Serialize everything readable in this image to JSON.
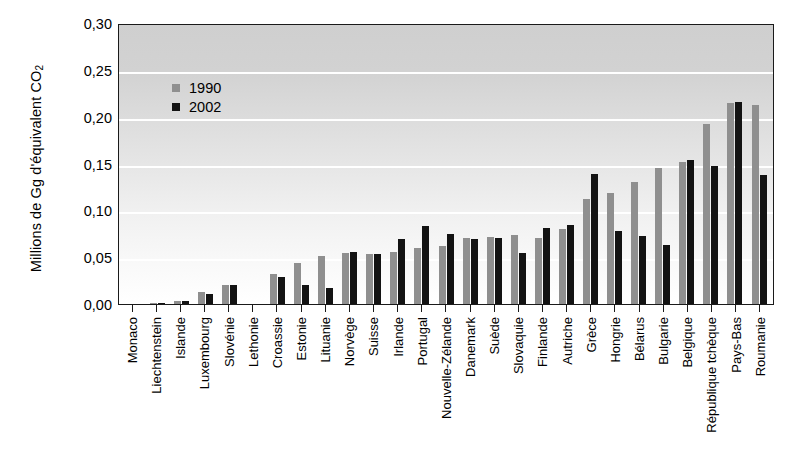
{
  "chart_data": {
    "type": "bar",
    "title": "",
    "xlabel": "",
    "ylabel": "Millions de Gg d'équivalent CO",
    "ylabel_sub": "2",
    "ylim": [
      0,
      0.3
    ],
    "ytick_labels": [
      "0,30",
      "0,25",
      "0,20",
      "0,15",
      "0,10",
      "0,05",
      "0,00"
    ],
    "ytick_values": [
      0.3,
      0.25,
      0.2,
      0.15,
      0.1,
      0.05,
      0.0
    ],
    "grid": true,
    "legend_position": "upper-left-inside",
    "categories": [
      "Monaco",
      "Liechtenstein",
      "Islande",
      "Luxembourg",
      "Slovénie",
      "Lethonie",
      "Croassie",
      "Estonie",
      "Lituanie",
      "Norvège",
      "Suisse",
      "Irlande",
      "Portugal",
      "Nouvelle-Zélande",
      "Danemark",
      "Suède",
      "Slovaquie",
      "Finlande",
      "Autriche",
      "Grèce",
      "Hongrie",
      "Bélarus",
      "Bulgarie",
      "Belgique",
      "République tchèque",
      "Pays-Bas",
      "Roumanie"
    ],
    "series": [
      {
        "name": "1990",
        "color": "#8f8f8f",
        "values": [
          0.0,
          0.001,
          0.003,
          0.013,
          0.02,
          0.0,
          0.032,
          0.044,
          0.051,
          0.054,
          0.053,
          0.055,
          0.06,
          0.062,
          0.07,
          0.072,
          0.074,
          0.071,
          0.08,
          0.112,
          0.118,
          0.13,
          0.145,
          0.152,
          0.192,
          0.215,
          0.213
        ]
      },
      {
        "name": "2002",
        "color": "#131313",
        "values": [
          0.0,
          0.001,
          0.003,
          0.011,
          0.02,
          0.0,
          0.029,
          0.02,
          0.017,
          0.055,
          0.053,
          0.069,
          0.083,
          0.075,
          0.069,
          0.071,
          0.054,
          0.081,
          0.084,
          0.139,
          0.078,
          0.073,
          0.063,
          0.154,
          0.147,
          0.216,
          0.138
        ]
      }
    ]
  },
  "legend": {
    "entries": [
      {
        "label": "1990"
      },
      {
        "label": "2002"
      }
    ]
  }
}
